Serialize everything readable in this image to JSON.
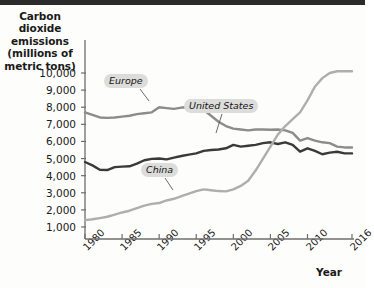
{
  "chart_data": {
    "type": "line",
    "title": "Carbon dioxide emissions (millions of metric tons)",
    "ylabel_lines": [
      "Carbon dioxide",
      "emissions",
      "(millions of",
      "metric tons)"
    ],
    "xlabel": "Year",
    "grid": false,
    "legend_position": "inline-callout",
    "xlim": [
      1980,
      2016
    ],
    "ylim": [
      0,
      10500
    ],
    "yticks": [
      1000,
      2000,
      3000,
      4000,
      5000,
      6000,
      7000,
      8000,
      9000,
      10000
    ],
    "ytick_labels": [
      "1,000",
      "2,000",
      "3,000",
      "4,000",
      "5,000",
      "6,000",
      "7,000",
      "8,000",
      "9,000",
      "10,000"
    ],
    "xticks": [
      1980,
      1985,
      1990,
      1995,
      2000,
      2005,
      2010,
      2016
    ],
    "xtick_labels": [
      "1980",
      "1985",
      "1990",
      "1995",
      "2000",
      "2005",
      "2010",
      "2016"
    ],
    "x": [
      1980,
      1981,
      1982,
      1983,
      1984,
      1985,
      1986,
      1987,
      1988,
      1989,
      1990,
      1991,
      1992,
      1993,
      1994,
      1995,
      1996,
      1997,
      1998,
      1999,
      2000,
      2001,
      2002,
      2003,
      2004,
      2005,
      2006,
      2007,
      2008,
      2009,
      2010,
      2011,
      2012,
      2013,
      2014,
      2015,
      2016
    ],
    "series": [
      {
        "name": "Europe",
        "color": "#8c8c8c",
        "values": [
          7700,
          7550,
          7400,
          7380,
          7400,
          7450,
          7500,
          7600,
          7650,
          7700,
          8000,
          7950,
          7900,
          7980,
          8000,
          7980,
          7850,
          7500,
          7150,
          6900,
          6750,
          6700,
          6650,
          6700,
          6700,
          6680,
          6700,
          6650,
          6500,
          6050,
          6200,
          6050,
          5950,
          5900,
          5700,
          5650,
          5650
        ]
      },
      {
        "name": "United States",
        "color": "#3a3a3a",
        "values": [
          4800,
          4600,
          4350,
          4330,
          4500,
          4530,
          4550,
          4700,
          4900,
          4980,
          5000,
          4950,
          5050,
          5150,
          5230,
          5300,
          5450,
          5500,
          5530,
          5600,
          5800,
          5700,
          5750,
          5800,
          5900,
          5950,
          5850,
          5950,
          5800,
          5400,
          5600,
          5450,
          5250,
          5350,
          5400,
          5300,
          5300
        ]
      },
      {
        "name": "China",
        "color": "#aeaeae",
        "values": [
          1400,
          1450,
          1520,
          1600,
          1720,
          1850,
          1950,
          2100,
          2250,
          2350,
          2400,
          2550,
          2650,
          2800,
          2950,
          3100,
          3200,
          3150,
          3100,
          3080,
          3200,
          3400,
          3700,
          4300,
          5000,
          5700,
          6400,
          6900,
          7300,
          7700,
          8400,
          9200,
          9700,
          10000,
          10100,
          10100,
          10100
        ]
      }
    ],
    "annotations": [
      {
        "name": "Europe",
        "label_x": 104,
        "label_y": 74,
        "leader_from": [
          140,
          89
        ],
        "leader_to": [
          149,
          101
        ]
      },
      {
        "name": "United States",
        "label_x": 184,
        "label_y": 99,
        "leader_from": [
          222,
          114
        ],
        "leader_to": [
          216,
          133
        ]
      },
      {
        "name": "China",
        "label_x": 141,
        "label_y": 163,
        "leader_from": [
          165,
          178
        ],
        "leader_to": [
          173,
          190
        ]
      }
    ]
  },
  "axis_title_x_pos": {
    "left": 316,
    "top": 266
  }
}
